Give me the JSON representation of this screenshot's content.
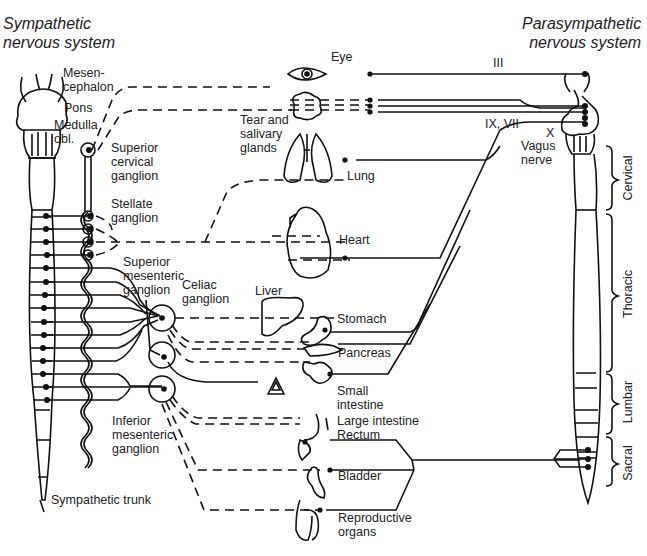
{
  "titles": {
    "sympathetic": "Sympathetic\nnervous system",
    "parasympathetic": "Parasympathetic\nnervous system"
  },
  "brain_labels": {
    "mesencephalon": "Mesen-\ncephalon",
    "pons": "Pons",
    "medulla": "Medulla\nobl."
  },
  "ganglia": {
    "superior_cervical": "Superior\ncervical\nganglion",
    "stellate": "Stellate\nganglion",
    "superior_mesenteric": "Superior\nmesenteric\nganglion",
    "celiac": "Celiac\nganglion",
    "inferior_mesenteric": "Inferior\nmesenteric\nganglion",
    "sympathetic_trunk": "Sympathetic trunk"
  },
  "organs": {
    "eye": "Eye",
    "tear_salivary": "Tear and\nsalivary\nglands",
    "lung": "Lung",
    "heart": "Heart",
    "liver": "Liver",
    "stomach": "Stomach",
    "pancreas": "Pancreas",
    "small_intestine": "Small\nintestine",
    "large_intestine": "Large intestine\nRectum",
    "bladder": "Bladder",
    "reproductive": "Reproductive\norgans"
  },
  "cranial_nerves": {
    "iii": "III",
    "ix_vii": "IX, VII",
    "x": "X",
    "vagus": "Vagus\nnerve"
  },
  "spinal_regions": {
    "cervical": "Cervical",
    "thoracic": "Thoracic",
    "lumbar": "Lumbar",
    "sacral": "Sacral"
  },
  "colors": {
    "line": "#111111",
    "text": "#222222",
    "background": "#ffffff"
  }
}
